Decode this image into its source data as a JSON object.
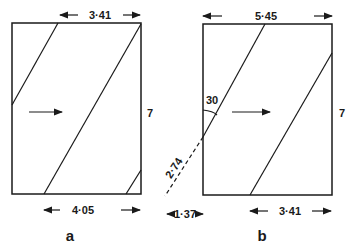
{
  "figure_a": {
    "caption": "a",
    "top_width": "3·41",
    "bottom_width": "4·05",
    "height": "7",
    "flow_arrow": "arrow-right-icon"
  },
  "figure_b": {
    "caption": "b",
    "top_width": "5·45",
    "bottom_width": "3·41",
    "height": "7",
    "angle": "30",
    "slant_length": "2·74",
    "offset": "1·37",
    "flow_arrow": "arrow-right-icon"
  },
  "colors": {
    "ink": "#1a1a1a",
    "background": "#ffffff"
  }
}
